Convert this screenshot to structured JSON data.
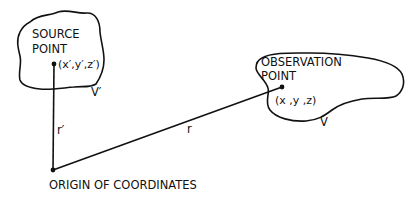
{
  "diagram": {
    "source": {
      "title_line1": "SOURCE",
      "title_line2": "POINT",
      "coords": "(x′,y′,z′)",
      "volume_label": "V′"
    },
    "observation": {
      "title_line1": "OBSERVATION",
      "title_line2": "POINT",
      "coords": "(x ,y ,z)",
      "volume_label": "V"
    },
    "vectors": {
      "source_vector_label": "r′",
      "observation_vector_label": "r"
    },
    "origin": {
      "label": "ORIGIN OF COORDINATES"
    },
    "colors": {
      "ink": "#111111",
      "background": "#ffffff"
    }
  }
}
